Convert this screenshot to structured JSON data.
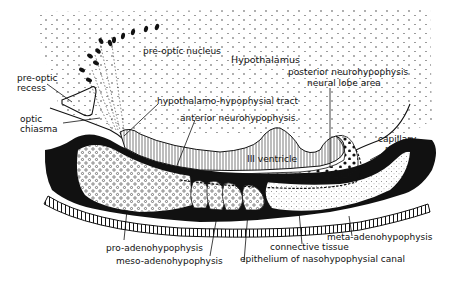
{
  "figure": {
    "type": "anatomical cross-section"
  },
  "labels": {
    "hypothalamus": "Hypothalamus",
    "pre_optic_nucleus": "pre-optic nucleus",
    "pre_optic_recess_line1": "pre-optic",
    "pre_optic_recess_line2": "recess",
    "optic_chiasma_line1": "optic",
    "optic_chiasma_line2": "chiasma",
    "hypothalamo_hypophysial_tract": "hypothalamo-hypophysial tract",
    "anterior_neurohypophysis": "anterior neurohypophysis.",
    "posterior_neurohypophysis": "posterior neurohypophysis",
    "neural_lobe_area": "neural lobe area",
    "third_ventricle": "III ventricle",
    "capillary_plexus_line1": "capillary",
    "capillary_plexus_line2": "plexus",
    "pro_adenohypophysis": "pro-adenohypophysis",
    "meso_adenohypophysis": "meso-adenohypophysis",
    "meta_adenohypophysis": "meta-adenohypophysis",
    "connective_tissue": "connective tissue",
    "epithelium_canal": "epithelium of nasohypophysial canal"
  },
  "colors": {
    "ink": "#111111",
    "background": "#ffffff"
  }
}
